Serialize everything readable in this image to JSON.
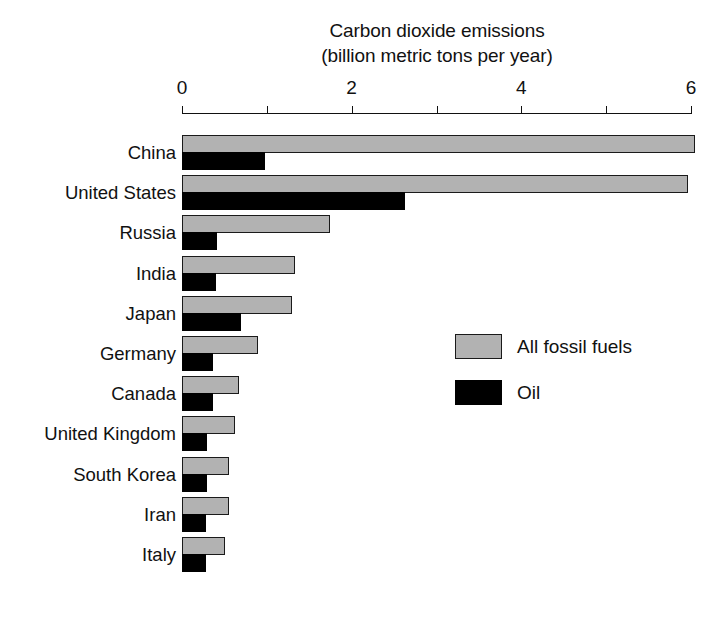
{
  "chart_data": {
    "type": "bar",
    "orientation": "horizontal",
    "title": "Carbon dioxide emissions",
    "subtitle": "(billion metric tons per year)",
    "xlabel": "",
    "ylabel": "",
    "xlim": [
      0,
      6
    ],
    "grid": false,
    "legend_position": "center-right",
    "tick_values": [
      0,
      1,
      2,
      3,
      4,
      5,
      6
    ],
    "tick_labels": [
      "0",
      "",
      "2",
      "",
      "4",
      "",
      "6"
    ],
    "categories": [
      "China",
      "United States",
      "Russia",
      "India",
      "Japan",
      "Germany",
      "Canada",
      "United Kingdom",
      "South Korea",
      "Iran",
      "Italy"
    ],
    "series": [
      {
        "name": "All fossil fuels",
        "color": "#b2b2b2",
        "values": [
          6.05,
          5.97,
          1.74,
          1.33,
          1.3,
          0.89,
          0.67,
          0.63,
          0.55,
          0.55,
          0.51
        ]
      },
      {
        "name": "Oil",
        "color": "#000000",
        "values": [
          0.98,
          2.63,
          0.41,
          0.4,
          0.7,
          0.37,
          0.36,
          0.3,
          0.3,
          0.28,
          0.28
        ]
      }
    ]
  },
  "legend": {
    "items": [
      {
        "label": "All fossil fuels",
        "swatch": "total"
      },
      {
        "label": "Oil",
        "swatch": "oil"
      }
    ]
  }
}
